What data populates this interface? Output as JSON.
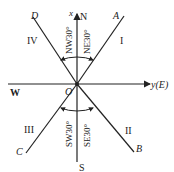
{
  "diagram": {
    "type": "compass-direction-sector",
    "origin_label": "O",
    "axes": {
      "vertical_label": "x",
      "vertical_direction": "N",
      "horizontal_label": "y(E)",
      "west_label": "W",
      "south_label": "S"
    },
    "lines": {
      "upper_right": "A",
      "lower_right": "B",
      "lower_left": "C",
      "upper_left": "D"
    },
    "quadrants": {
      "I": "I",
      "II": "II",
      "III": "III",
      "IV": "IV"
    },
    "angles": {
      "nw": "NW30°",
      "ne": "NE30°",
      "sw": "SW30°",
      "se": "SE30°"
    },
    "colors": {
      "line": "#222222",
      "background": "#ffffff"
    }
  }
}
